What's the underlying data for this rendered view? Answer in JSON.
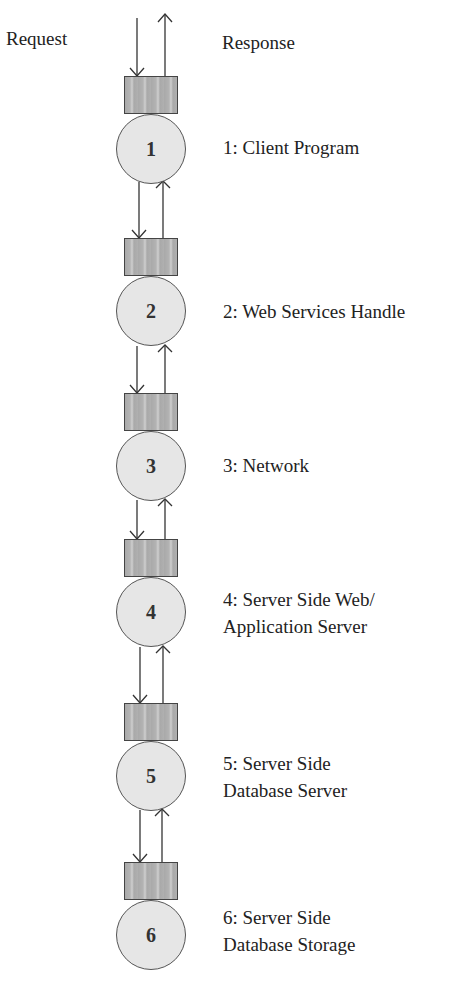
{
  "diagram": {
    "headers": {
      "request": "Request",
      "response": "Response"
    },
    "colors": {
      "queue_fill": "#a9a9a9",
      "node_fill": "#e6e6e6",
      "stroke": "#444444",
      "text": "#222222"
    },
    "stages": [
      {
        "number": "1",
        "label_lines": [
          "1: Client Program"
        ]
      },
      {
        "number": "2",
        "label_lines": [
          "2: Web Services Handle"
        ]
      },
      {
        "number": "3",
        "label_lines": [
          "3: Network"
        ]
      },
      {
        "number": "4",
        "label_lines": [
          "4: Server Side Web/",
          "Application Server"
        ]
      },
      {
        "number": "5",
        "label_lines": [
          "5: Server Side",
          "Database Server"
        ]
      },
      {
        "number": "6",
        "label_lines": [
          "6: Server Side",
          "Database Storage"
        ]
      }
    ]
  }
}
